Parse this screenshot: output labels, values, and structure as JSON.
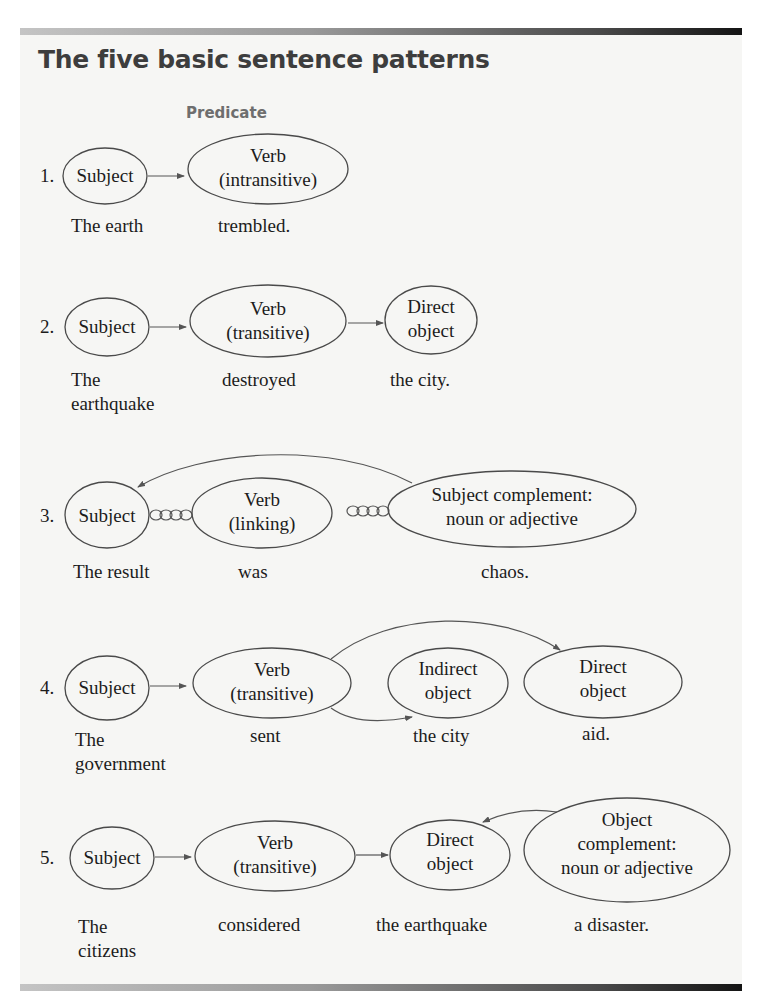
{
  "header": {
    "title": "The five basic sentence patterns",
    "predicate_label": "Predicate"
  },
  "colors": {
    "title": "#3d3d3d",
    "predicate": "#6e6e6e",
    "panel_bg": "#f6f6f4",
    "bar_start": "#c4c4c4",
    "bar_end": "#141414"
  },
  "patterns": [
    {
      "number": "1.",
      "nodes": [
        {
          "lines": [
            "Subject"
          ]
        },
        {
          "lines": [
            "Verb",
            "(intransitive)"
          ]
        }
      ],
      "example": [
        "The earth",
        "trembled."
      ]
    },
    {
      "number": "2.",
      "nodes": [
        {
          "lines": [
            "Subject"
          ]
        },
        {
          "lines": [
            "Verb",
            "(transitive)"
          ]
        },
        {
          "lines": [
            "Direct",
            "object"
          ]
        }
      ],
      "example": [
        [
          "The",
          "earthquake"
        ],
        "destroyed",
        "the city."
      ]
    },
    {
      "number": "3.",
      "nodes": [
        {
          "lines": [
            "Subject"
          ]
        },
        {
          "lines": [
            "Verb",
            "(linking)"
          ]
        },
        {
          "lines": [
            "Subject complement:",
            "noun or adjective"
          ]
        }
      ],
      "example": [
        "The result",
        "was",
        "chaos."
      ]
    },
    {
      "number": "4.",
      "nodes": [
        {
          "lines": [
            "Subject"
          ]
        },
        {
          "lines": [
            "Verb",
            "(transitive)"
          ]
        },
        {
          "lines": [
            "Indirect",
            "object"
          ]
        },
        {
          "lines": [
            "Direct",
            "object"
          ]
        }
      ],
      "example": [
        [
          "The",
          "government"
        ],
        "sent",
        "the city",
        "aid."
      ]
    },
    {
      "number": "5.",
      "nodes": [
        {
          "lines": [
            "Subject"
          ]
        },
        {
          "lines": [
            "Verb",
            "(transitive)"
          ]
        },
        {
          "lines": [
            "Direct",
            "object"
          ]
        },
        {
          "lines": [
            "Object",
            "complement:",
            "noun or adjective"
          ]
        }
      ],
      "example": [
        [
          "The",
          "citizens"
        ],
        "considered",
        "the earthquake",
        "a disaster."
      ]
    }
  ]
}
